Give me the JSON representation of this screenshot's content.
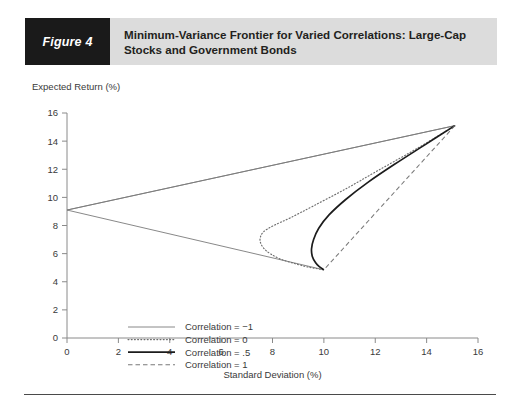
{
  "figure": {
    "tag": "Figure 4",
    "title": "Minimum-Variance Frontier for Varied Correlations: Large-Cap Stocks and Government Bonds"
  },
  "colors": {
    "tag_background": "#1a1a1a",
    "title_background": "#dcdcdc",
    "axis": "#8a8a8a",
    "corr_neg1": "#7a7a7a",
    "corr_0": "#6e6e6e",
    "corr_05": "#1c1c1c",
    "corr_1": "#7a7a7a"
  },
  "chart_data": {
    "type": "line",
    "title": "Minimum-Variance Frontier for Varied Correlations: Large-Cap Stocks and Government Bonds",
    "xlabel": "Standard Deviation (%)",
    "ylabel": "Expected Return (%)",
    "xlim": [
      0,
      16
    ],
    "ylim": [
      0,
      16
    ],
    "xticks": [
      0,
      2,
      4,
      6,
      8,
      10,
      12,
      14,
      16
    ],
    "yticks": [
      0,
      2,
      4,
      6,
      8,
      10,
      12,
      14,
      16
    ],
    "grid": false,
    "legend_position": "center-left",
    "endpoints": {
      "bonds": {
        "sd": 0.0,
        "ret": 9.1,
        "note": "100% bonds (correlation = -1 vertex)"
      },
      "stocks": {
        "sd": 15.1,
        "ret": 15.1,
        "note": "100% large-cap stocks"
      },
      "lower_vertex": {
        "sd": 10.0,
        "ret": 4.85,
        "note": "lower end of frontier branches"
      }
    },
    "series": [
      {
        "name": "Correlation = −1",
        "key": "corr_neg1",
        "style": "solid-thin",
        "points": [
          [
            0.0,
            9.1
          ],
          [
            15.1,
            15.1
          ],
          [
            0.0,
            9.1
          ],
          [
            10.0,
            4.85
          ]
        ],
        "path_note": "V shape: two straight segments meeting at (0, 9.1)"
      },
      {
        "name": "Correlation = 0",
        "key": "corr_0",
        "style": "dotted",
        "points": [
          [
            15.1,
            15.1
          ],
          [
            13.6,
            13.45
          ],
          [
            12.1,
            11.9
          ],
          [
            10.8,
            10.55
          ],
          [
            9.6,
            9.4
          ],
          [
            8.7,
            8.55
          ],
          [
            8.05,
            8.0
          ],
          [
            7.65,
            7.55
          ],
          [
            7.52,
            7.1
          ],
          [
            7.55,
            6.7
          ],
          [
            7.7,
            6.3
          ],
          [
            7.95,
            5.95
          ],
          [
            8.3,
            5.62
          ],
          [
            8.75,
            5.35
          ],
          [
            9.25,
            5.1
          ],
          [
            9.6,
            4.97
          ],
          [
            10.0,
            4.85
          ]
        ]
      },
      {
        "name": "Correlation = .5",
        "key": "corr_05",
        "style": "solid-thick",
        "points": [
          [
            15.1,
            15.1
          ],
          [
            13.9,
            13.7
          ],
          [
            12.75,
            12.35
          ],
          [
            11.7,
            11.05
          ],
          [
            10.85,
            9.85
          ],
          [
            10.2,
            8.75
          ],
          [
            9.8,
            7.8
          ],
          [
            9.6,
            7.0
          ],
          [
            9.52,
            6.35
          ],
          [
            9.55,
            5.8
          ],
          [
            9.68,
            5.35
          ],
          [
            9.82,
            5.08
          ],
          [
            10.0,
            4.85
          ]
        ]
      },
      {
        "name": "Correlation = 1",
        "key": "corr_1",
        "style": "dashed",
        "points": [
          [
            15.1,
            15.1
          ],
          [
            10.0,
            4.85
          ]
        ],
        "path_note": "straight line between the two asset endpoints"
      }
    ],
    "legend": [
      {
        "label": "Correlation = −1",
        "style": "solid-thin"
      },
      {
        "label": "Correlation = 0",
        "style": "dotted"
      },
      {
        "label": "Correlation = .5",
        "style": "solid-thick"
      },
      {
        "label": "Correlation = 1",
        "style": "dashed"
      }
    ]
  }
}
